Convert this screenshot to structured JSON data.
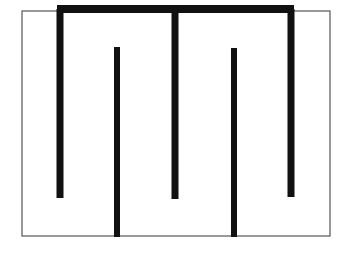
{
  "figure": {
    "canvas": {
      "width": 338,
      "height": 266,
      "background": "#ffffff"
    },
    "ink_color": "#111111",
    "thin_color": "#555555",
    "frame": {
      "name": "outer-thin-rectangle",
      "x": 22,
      "y": 11,
      "width": 308,
      "height": 225,
      "stroke_width": 1.2,
      "stroke": "#555555",
      "fill": "none"
    },
    "top_rail": {
      "name": "top-thick-horizontal-bar",
      "x1": 57,
      "y1": 9,
      "x2": 294,
      "y2": 9,
      "stroke_width": 8,
      "stroke": "#111111"
    },
    "bars": [
      {
        "name": "prong-1-left",
        "attached_to": "top-rail",
        "x": 60,
        "y_top": 9,
        "y_bottom": 198,
        "stroke_width": 7,
        "stroke": "#111111"
      },
      {
        "name": "prong-2-hanging",
        "attached_to": "bottom-edge",
        "x": 117,
        "y_top": 47,
        "y_bottom": 237,
        "stroke_width": 6,
        "stroke": "#111111"
      },
      {
        "name": "prong-3-middle",
        "attached_to": "top-rail",
        "x": 175,
        "y_top": 9,
        "y_bottom": 199,
        "stroke_width": 7,
        "stroke": "#111111"
      },
      {
        "name": "prong-4-hanging",
        "attached_to": "bottom-edge",
        "x": 234,
        "y_top": 48,
        "y_bottom": 237,
        "stroke_width": 6,
        "stroke": "#111111"
      },
      {
        "name": "prong-5-right",
        "attached_to": "top-rail",
        "x": 291,
        "y_top": 9,
        "y_bottom": 197,
        "stroke_width": 7,
        "stroke": "#111111"
      }
    ]
  }
}
